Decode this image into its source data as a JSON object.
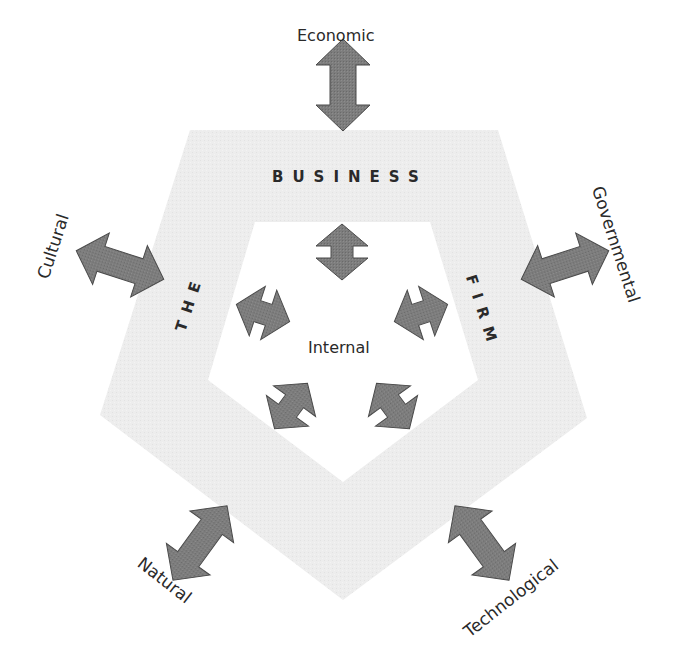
{
  "diagram": {
    "ring_words": {
      "top": "BUSINESS",
      "left": "THE",
      "right": "FIRM"
    },
    "center_label": "Internal",
    "external_forces": [
      {
        "id": "economic",
        "label": "Economic"
      },
      {
        "id": "governmental",
        "label": "Governmental"
      },
      {
        "id": "technological",
        "label": "Technological"
      },
      {
        "id": "natural",
        "label": "Natural"
      },
      {
        "id": "cultural",
        "label": "Cultural"
      }
    ],
    "internal_arrow_count": 5,
    "colors": {
      "ring_fill": "#ececec",
      "arrow_fill": "#7a7a7a",
      "arrow_stroke": "#4a4a4a",
      "text": "#2a2a2a",
      "background": "#ffffff"
    }
  }
}
